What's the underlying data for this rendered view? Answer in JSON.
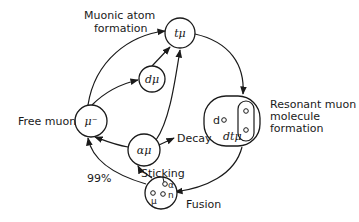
{
  "diagram": {
    "nodes": {
      "free_muon": {
        "symbol": "μ⁻",
        "label": "Free muon"
      },
      "t_mu": {
        "symbol": "tμ"
      },
      "d_mu": {
        "symbol": "dμ"
      },
      "alpha_mu": {
        "symbol": "αμ"
      },
      "molecule": {
        "d_label": "d",
        "dt_label": "dtμ",
        "label_lines": [
          "Resonant muon",
          "molecule",
          "formation"
        ]
      },
      "fusion": {
        "particles": [
          "α",
          "μ",
          "n"
        ],
        "label": "Fusion"
      }
    },
    "labels": {
      "muonic_atom_line1": "Muonic atom",
      "muonic_atom_line2": "formation",
      "decay": "Decay",
      "sticking": "Sticking",
      "percent": "99%"
    },
    "colors": {
      "ink": "#1a1a1a",
      "background": "#ffffff"
    }
  }
}
